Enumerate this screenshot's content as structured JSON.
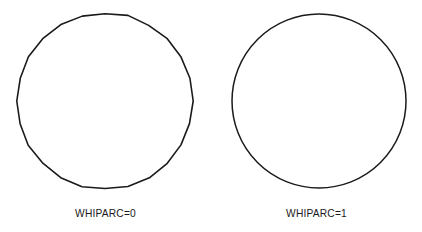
{
  "figure": {
    "background_color": "#ffffff",
    "stroke_color": "#1a1a1a",
    "width": 422,
    "height": 232
  },
  "panels": [
    {
      "id": "whiparc-0",
      "label": "WHIPARC=0",
      "shape": "polygon-approximated-circle",
      "description": "circle drawn as a many-sided polygon with visible straight chord segments",
      "center_x": 105,
      "center_y": 101,
      "radius": 88,
      "sides": 24
    },
    {
      "id": "whiparc-1",
      "label": "WHIPARC=1",
      "shape": "smooth-circle",
      "description": "circle drawn as a smooth continuous arc",
      "center_x": 108,
      "center_y": 101,
      "radius": 87,
      "sides": 0
    }
  ],
  "chart_data": {
    "type": "scatter",
    "title": "",
    "subtitle": "",
    "xlabel": "",
    "ylabel": "",
    "grid": false,
    "legend": "none",
    "annotations": [
      "WHIPARC=0",
      "WHIPARC=1"
    ],
    "series": [
      {
        "name": "WHIPARC=0",
        "shape": "polygon",
        "center": [
          105,
          101
        ],
        "radius": 88,
        "vertices": 24
      },
      {
        "name": "WHIPARC=1",
        "shape": "circle",
        "center": [
          319,
          101
        ],
        "radius": 87,
        "vertices": 0
      }
    ]
  }
}
